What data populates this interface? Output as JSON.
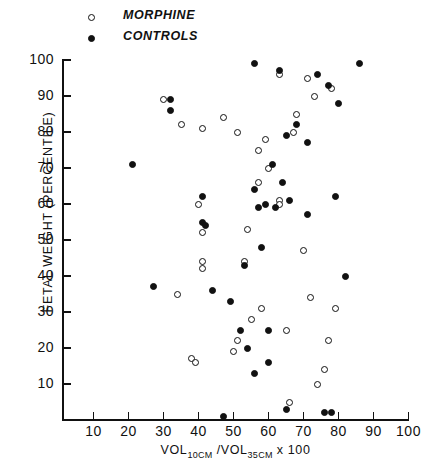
{
  "legend": {
    "entries": [
      {
        "label": "MORPHINE",
        "marker": "open-circle-icon"
      },
      {
        "label": "CONTROLS",
        "marker": "filled-circle-icon"
      }
    ]
  },
  "axes": {
    "y_title": "FETAL WEIGHT (PERCENTILE)",
    "x_title_prefix": "VOL",
    "x_title_sub1": "10CM",
    "x_title_mid": " /VOL",
    "x_title_sub2": "35CM",
    "x_title_suffix": " x 100",
    "y_ticks": [
      "100",
      "90",
      "80",
      "70",
      "60",
      "50",
      "40",
      "30",
      "20",
      "10"
    ],
    "x_ticks": [
      "10",
      "20",
      "30",
      "40",
      "50",
      "60",
      "70",
      "80",
      "90",
      "100"
    ]
  },
  "chart_data": {
    "type": "scatter",
    "title": "",
    "xlabel": "VOL10CM / VOL35CM x 100",
    "ylabel": "FETAL WEIGHT (PERCENTILE)",
    "xlim": [
      0,
      100
    ],
    "ylim": [
      0,
      100
    ],
    "grid": false,
    "legend_position": "top-left-outside",
    "series": [
      {
        "name": "MORPHINE",
        "marker": "open-circle",
        "color": "#111111",
        "points": [
          [
            30,
            89
          ],
          [
            35,
            82
          ],
          [
            41,
            81
          ],
          [
            47,
            84
          ],
          [
            51,
            80
          ],
          [
            63,
            96
          ],
          [
            71,
            95
          ],
          [
            73,
            90
          ],
          [
            78,
            92
          ],
          [
            68,
            85
          ],
          [
            67,
            80
          ],
          [
            59,
            78
          ],
          [
            57,
            75
          ],
          [
            60,
            70
          ],
          [
            57,
            66
          ],
          [
            63,
            61
          ],
          [
            63,
            60
          ],
          [
            40,
            60
          ],
          [
            41,
            52
          ],
          [
            41,
            44
          ],
          [
            41,
            42
          ],
          [
            54,
            53
          ],
          [
            53,
            44
          ],
          [
            34,
            35
          ],
          [
            38,
            17
          ],
          [
            51,
            22
          ],
          [
            50,
            19
          ],
          [
            58,
            31
          ],
          [
            55,
            28
          ],
          [
            70,
            47
          ],
          [
            72,
            34
          ],
          [
            65,
            25
          ],
          [
            79,
            31
          ],
          [
            77,
            22
          ],
          [
            76,
            14
          ],
          [
            66,
            5
          ],
          [
            74,
            10
          ],
          [
            39,
            16
          ]
        ]
      },
      {
        "name": "CONTROLS",
        "marker": "filled-circle",
        "color": "#111111",
        "points": [
          [
            32,
            89
          ],
          [
            32,
            86
          ],
          [
            56,
            99
          ],
          [
            63,
            97
          ],
          [
            74,
            96
          ],
          [
            86,
            99
          ],
          [
            80,
            88
          ],
          [
            77,
            93
          ],
          [
            68,
            82
          ],
          [
            65,
            79
          ],
          [
            71,
            77
          ],
          [
            61,
            71
          ],
          [
            56,
            64
          ],
          [
            21,
            71
          ],
          [
            27,
            37
          ],
          [
            41,
            62
          ],
          [
            41,
            55
          ],
          [
            42,
            54
          ],
          [
            53,
            43
          ],
          [
            57,
            59
          ],
          [
            59,
            60
          ],
          [
            62,
            59
          ],
          [
            64,
            66
          ],
          [
            66,
            61
          ],
          [
            71,
            57
          ],
          [
            79,
            62
          ],
          [
            82,
            40
          ],
          [
            52,
            25
          ],
          [
            54,
            20
          ],
          [
            56,
            13
          ],
          [
            60,
            25
          ],
          [
            47,
            1
          ],
          [
            65,
            3
          ],
          [
            76,
            2
          ],
          [
            78,
            2
          ],
          [
            60,
            16
          ],
          [
            49,
            33
          ],
          [
            58,
            48
          ],
          [
            44,
            36
          ]
        ]
      }
    ]
  }
}
